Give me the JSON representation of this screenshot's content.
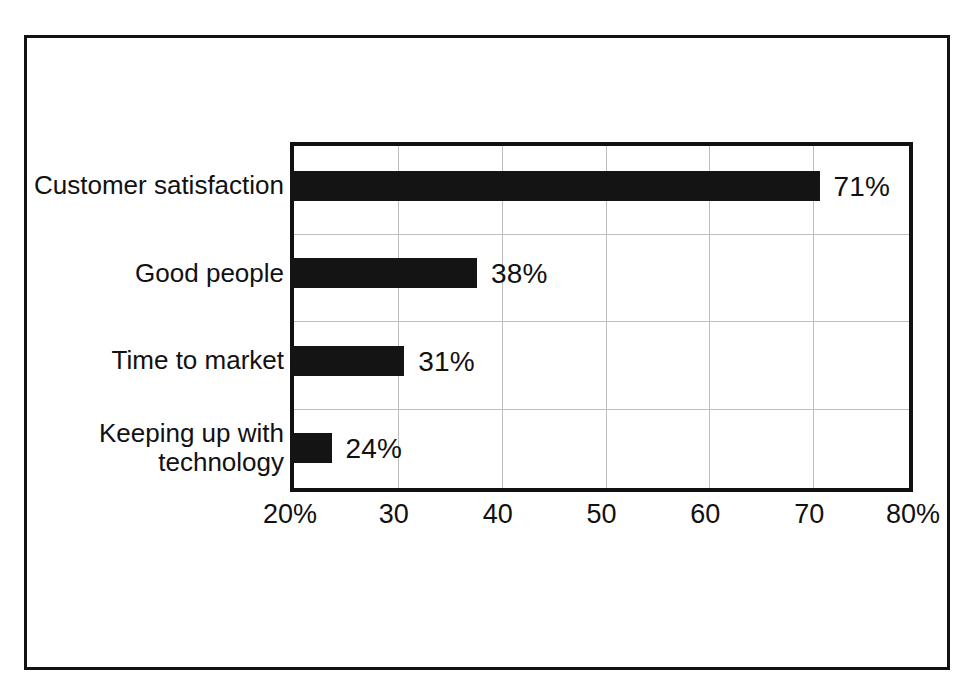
{
  "chart_data": {
    "type": "bar",
    "orientation": "horizontal",
    "title": "",
    "xlabel": "",
    "ylabel": "",
    "xlim": [
      20,
      80
    ],
    "grid": true,
    "legend": null,
    "categories": [
      "Customer satisfaction",
      "Good people",
      "Time to market",
      "Keeping up with\ntechnology"
    ],
    "values": [
      71,
      38,
      31,
      24
    ],
    "value_labels": [
      "71%",
      "38%",
      "31%",
      "24%"
    ],
    "xticks": [
      20,
      30,
      40,
      50,
      60,
      70,
      80
    ],
    "xtick_labels": [
      "20%",
      "30",
      "40",
      "50",
      "60",
      "70",
      "80%"
    ],
    "bar_color": "#141414",
    "background_color": "#ffffff",
    "gridline_color": "#bdbdbd",
    "axis_color": "#111111"
  }
}
